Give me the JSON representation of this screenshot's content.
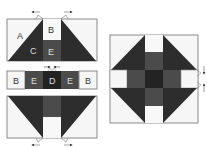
{
  "caption_cutoff": "· · · · · · · · · · · · · · · · · · · · · · · · · · · ·",
  "colors": {
    "light": "#f6f6f6",
    "medium": "#4b4b4b",
    "dark": "#2d2d2d",
    "darkest": "#232323",
    "border": "#8a8a8a",
    "label_on_light": "#333333",
    "label_on_dark": "#e6e6e6"
  },
  "diagram": {
    "top_panel": {
      "labels": {
        "a": "A",
        "b": "B",
        "c": "C",
        "e": "E"
      }
    },
    "middle_strip": {
      "labels": [
        "B",
        "E",
        "D",
        "E",
        "B"
      ]
    },
    "bottom_panel": {},
    "assembled_block": {}
  }
}
